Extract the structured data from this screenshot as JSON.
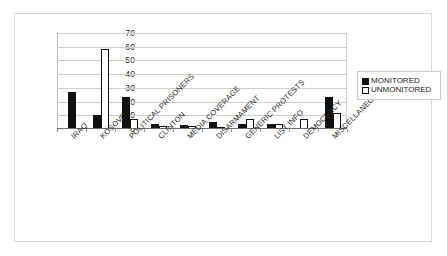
{
  "chart_data": {
    "type": "bar",
    "title": "",
    "subtitle": "",
    "xlabel": "",
    "ylabel": "",
    "ylim": [
      0,
      70
    ],
    "ytick_step": 10,
    "yticks": [
      70,
      60,
      50,
      40,
      30,
      20,
      10,
      0
    ],
    "grid": true,
    "legend_position": "right",
    "categories": [
      "IRAQ",
      "KOSOVO",
      "POLITICAL PRISONERS",
      "CLINTON",
      "MEDIA COVERAGE",
      "DISARMAMENT",
      "GENERIC PROTESTS",
      "LIST INFO",
      "DEMOCRACY",
      "MISCELLANEOUS"
    ],
    "series": [
      {
        "name": "MONITORED",
        "color": "#111111",
        "fill": "solid",
        "values": [
          27,
          10,
          23,
          4,
          3,
          5,
          4,
          4,
          0,
          23
        ]
      },
      {
        "name": "UNMONITORED",
        "color": "#ffffff",
        "fill": "hollow",
        "values": [
          0,
          58,
          7,
          2,
          2,
          1,
          7,
          4,
          7,
          12
        ]
      }
    ]
  },
  "legend": {
    "entries": [
      {
        "label": "MONITORED",
        "swatch": "filled-square-icon"
      },
      {
        "label": "UNMONITORED",
        "swatch": "hollow-square-icon"
      }
    ]
  }
}
